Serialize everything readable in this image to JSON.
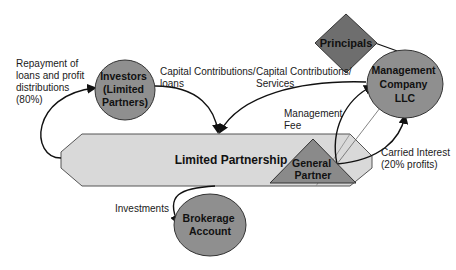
{
  "diagram": {
    "colors": {
      "circle_fill": "#8f8f8f",
      "diamond_fill": "#6e6e6e",
      "triangle_fill": "#8a8a8a",
      "partnership_fill": "#d9d9d9",
      "stroke": "#222222"
    },
    "nodes": {
      "investors": {
        "lines": [
          "Investors",
          "(Limited",
          "Partners)"
        ]
      },
      "principals": {
        "label": "Principals"
      },
      "management": {
        "lines": [
          "Management",
          "Company",
          "LLC"
        ]
      },
      "partnership": {
        "label": "Limited Partnership"
      },
      "general_partner": {
        "lines": [
          "General",
          "Partner"
        ]
      },
      "brokerage": {
        "lines": [
          "Brokerage",
          "Account"
        ]
      }
    },
    "edges": {
      "repayment": "Repayment of\nloans and profit\ndistributions\n(80%)",
      "capital_loans": "Capital Contributions/\nloans",
      "capital_services": "Capital Contributions/\nServices",
      "management_fee": "Management\nFee",
      "carried_interest": "Carried Interest\n(20% profits)",
      "investments": "Investments"
    }
  }
}
